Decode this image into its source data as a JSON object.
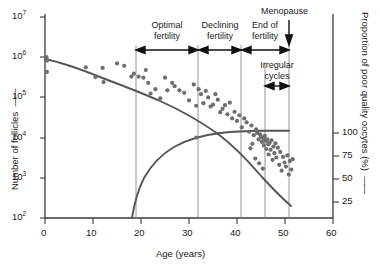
{
  "chart_data": {
    "type": "scatter",
    "title": "",
    "xlabel": "Age (years)",
    "ylabel": "Number of follicles",
    "y2label": "Proportion of poor quality oocytes (%)",
    "xlim": [
      0,
      60
    ],
    "xticks": [
      0,
      10,
      20,
      30,
      40,
      50,
      60
    ],
    "xticklabels": [
      "0",
      "10",
      "20",
      "30",
      "40",
      "50",
      "60"
    ],
    "ylim_log10": [
      2,
      7
    ],
    "yticks": [
      "10^2",
      "10^3",
      "10^4",
      "10^5",
      "10^6",
      "10^7"
    ],
    "yticklabels": [
      "10",
      "10",
      "10",
      "10",
      "10",
      "10"
    ],
    "yticksup": [
      "2",
      "3",
      "4",
      "5",
      "6",
      "7"
    ],
    "y2ticks": [
      25,
      50,
      75,
      100
    ],
    "y2ticklabels": [
      "25",
      "50",
      "75",
      "100"
    ],
    "grid": false,
    "legend": "none",
    "series": [
      {
        "name": "Number of follicles",
        "type": "scatter",
        "marker_color": "#6e6e6e",
        "points": [
          [
            0.3,
            1000000
          ],
          [
            0.3,
            900000
          ],
          [
            0.4,
            820000
          ],
          [
            0.4,
            430000
          ],
          [
            8.5,
            560000
          ],
          [
            10.5,
            320000
          ],
          [
            12.0,
            540000
          ],
          [
            12.2,
            240000
          ],
          [
            15.0,
            700000
          ],
          [
            16.5,
            610000
          ],
          [
            18.0,
            330000
          ],
          [
            18.5,
            390000
          ],
          [
            19.5,
            330000
          ],
          [
            20.5,
            310000
          ],
          [
            21.0,
            480000
          ],
          [
            21.5,
            230000
          ],
          [
            22.0,
            125000
          ],
          [
            23.0,
            160000
          ],
          [
            24.0,
            95000
          ],
          [
            25.0,
            310000
          ],
          [
            25.5,
            150000
          ],
          [
            26.5,
            230000
          ],
          [
            27.0,
            190000
          ],
          [
            28.0,
            150000
          ],
          [
            29.0,
            130000
          ],
          [
            30.0,
            84000
          ],
          [
            31.0,
            210000
          ],
          [
            31.5,
            62000
          ],
          [
            32.0,
            160000
          ],
          [
            32.5,
            120000
          ],
          [
            33.0,
            72000
          ],
          [
            33.5,
            145000
          ],
          [
            34.0,
            100000
          ],
          [
            34.5,
            59000
          ],
          [
            35.0,
            66000
          ],
          [
            35.5,
            120000
          ],
          [
            36.0,
            88000
          ],
          [
            36.5,
            43000
          ],
          [
            37.0,
            52000
          ],
          [
            37.5,
            64000
          ],
          [
            38.0,
            38000
          ],
          [
            38.5,
            74000
          ],
          [
            39.0,
            30000
          ],
          [
            39.5,
            44000
          ],
          [
            40.0,
            26000
          ],
          [
            40.5,
            36000
          ],
          [
            41.0,
            18000
          ],
          [
            41.5,
            30000
          ],
          [
            42.0,
            24000
          ],
          [
            42.5,
            14000
          ],
          [
            43.0,
            20000
          ],
          [
            43.5,
            11500
          ],
          [
            44.0,
            16000
          ],
          [
            44.2,
            13000
          ],
          [
            44.5,
            9000
          ],
          [
            44.8,
            12000
          ],
          [
            45.0,
            10500
          ],
          [
            45.2,
            7800
          ],
          [
            45.5,
            9500
          ],
          [
            45.6,
            6400
          ],
          [
            45.8,
            11000
          ],
          [
            46.0,
            8200
          ],
          [
            46.1,
            5200
          ],
          [
            46.3,
            9000
          ],
          [
            46.5,
            6800
          ],
          [
            46.6,
            3800
          ],
          [
            46.8,
            7400
          ],
          [
            47.0,
            5000
          ],
          [
            47.2,
            8600
          ],
          [
            47.4,
            2800
          ],
          [
            47.6,
            6000
          ],
          [
            47.8,
            4100
          ],
          [
            48.0,
            7200
          ],
          [
            48.2,
            3200
          ],
          [
            48.5,
            5600
          ],
          [
            48.8,
            2100
          ],
          [
            49.0,
            4400
          ],
          [
            49.3,
            1500
          ],
          [
            49.6,
            3300
          ],
          [
            49.9,
            2400
          ],
          [
            50.2,
            1900
          ],
          [
            50.5,
            3600
          ],
          [
            50.8,
            1200
          ],
          [
            51.0,
            2600
          ],
          [
            51.3,
            1600
          ],
          [
            51.6,
            2900
          ],
          [
            43.8,
            3000
          ],
          [
            42.8,
            5400
          ],
          [
            44.6,
            2300
          ],
          [
            45.4,
            1700
          ],
          [
            43.2,
            7000
          ],
          [
            31.5,
            10000
          ]
        ]
      },
      {
        "name": "Follicle decline curve",
        "type": "line",
        "color": "#555555",
        "description": "Smooth declining curve from ~7e5 at age 0 to ~1.2e3 at age 52"
      },
      {
        "name": "Poor quality oocytes curve",
        "type": "line",
        "color": "#555555",
        "axis": "right",
        "description": "Rises from 0% at age 18 to ~100% plateau at age 45, flat to 51"
      }
    ],
    "annotations": [
      {
        "label": "Optimal fertility",
        "x_start": 19,
        "x_end": 32
      },
      {
        "label": "Declining fertility",
        "x_start": 32,
        "x_end": 41
      },
      {
        "label": "End of fertility",
        "x_start": 41,
        "x_end": 51.5
      },
      {
        "label": "Menopause",
        "x": 51.5
      },
      {
        "label": "Irregular cycles",
        "x_start": 46,
        "x_end": 51.5
      }
    ],
    "dividers": [
      19,
      32,
      41,
      46,
      51.5
    ]
  },
  "axes": {
    "x_title": "Age (years)",
    "y_title": "Number of follicles",
    "y2_title": "Proportion of poor quality oocytes (%)",
    "x_ticklabels": [
      "0",
      "10",
      "20",
      "30",
      "40",
      "50",
      "60"
    ],
    "y_mantissa": "10",
    "y_exponents": [
      "7",
      "6",
      "5",
      "4",
      "3",
      "2"
    ],
    "y2_ticklabels": [
      "100",
      "75",
      "50",
      "25"
    ]
  },
  "annotations": {
    "optimal_line1": "Optimal",
    "optimal_line2": "fertility",
    "declining_line1": "Declining",
    "declining_line2": "fertility",
    "endof_line1": "End of",
    "endof_line2": "fertility",
    "menopause": "Menopause",
    "irregular_line1": "Irregular",
    "irregular_line2": "cycles"
  },
  "colors": {
    "marker": "#6e6e6e",
    "curve": "#555555",
    "axis": "#3a3a3a",
    "divider": "#8a8a8a",
    "text": "#1a1a1a"
  }
}
